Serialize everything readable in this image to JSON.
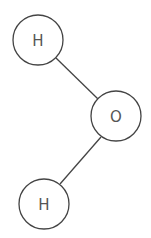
{
  "diagram": {
    "atoms": [
      {
        "id": "h1",
        "label": "H",
        "cx": 38,
        "cy": 40,
        "r": 25
      },
      {
        "id": "o",
        "label": "O",
        "cx": 116,
        "cy": 116,
        "r": 25
      },
      {
        "id": "h2",
        "label": "H",
        "cx": 44,
        "cy": 204,
        "r": 25
      }
    ],
    "bonds": [
      {
        "from": "h1",
        "to": "o"
      },
      {
        "from": "o",
        "to": "h2"
      }
    ],
    "colors": {
      "stroke": "#444444",
      "text": "#555555",
      "background": "#ffffff"
    }
  }
}
